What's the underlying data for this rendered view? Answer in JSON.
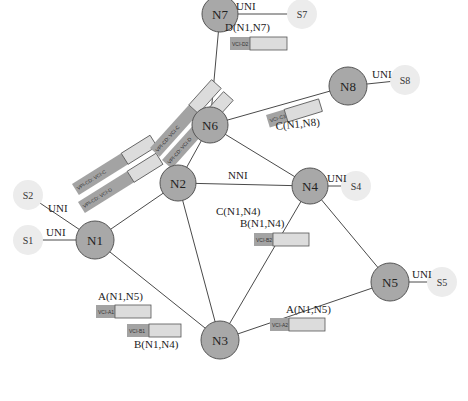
{
  "diagram": {
    "title": "",
    "colors": {
      "core_node": "#a8a8a8",
      "station_node": "#ececec",
      "box_dark": "#a3a3a3",
      "box_light": "#dcdcdc",
      "line": "#4a4a4a"
    },
    "core_nodes": [
      {
        "id": "N1",
        "label": "N1",
        "x": 95,
        "y": 240,
        "r": 19
      },
      {
        "id": "N2",
        "label": "N2",
        "x": 178,
        "y": 183,
        "r": 18
      },
      {
        "id": "N3",
        "label": "N3",
        "x": 220,
        "y": 340,
        "r": 19
      },
      {
        "id": "N4",
        "label": "N4",
        "x": 310,
        "y": 186,
        "r": 18
      },
      {
        "id": "N5",
        "label": "N5",
        "x": 390,
        "y": 282,
        "r": 19
      },
      {
        "id": "N6",
        "label": "N6",
        "x": 210,
        "y": 125,
        "r": 18
      },
      {
        "id": "N7",
        "label": "N7",
        "x": 220,
        "y": 14,
        "r": 18
      },
      {
        "id": "N8",
        "label": "N8",
        "x": 348,
        "y": 86,
        "r": 19
      }
    ],
    "stations": [
      {
        "id": "S1",
        "label": "S1",
        "x": 28,
        "y": 240,
        "r": 15
      },
      {
        "id": "S2",
        "label": "S2",
        "x": 28,
        "y": 195,
        "r": 15
      },
      {
        "id": "S4",
        "label": "S4",
        "x": 356,
        "y": 186,
        "r": 15
      },
      {
        "id": "S5",
        "label": "S5",
        "x": 442,
        "y": 282,
        "r": 15
      },
      {
        "id": "S7",
        "label": "S7",
        "x": 302,
        "y": 14,
        "r": 15
      },
      {
        "id": "S8",
        "label": "S8",
        "x": 405,
        "y": 80,
        "r": 15
      }
    ],
    "links": [
      {
        "from": "N1",
        "to": "N2"
      },
      {
        "from": "N1",
        "to": "N3"
      },
      {
        "from": "N2",
        "to": "N3"
      },
      {
        "from": "N2",
        "to": "N4"
      },
      {
        "from": "N2",
        "to": "N6"
      },
      {
        "from": "N3",
        "to": "N4"
      },
      {
        "from": "N3",
        "to": "N5"
      },
      {
        "from": "N4",
        "to": "N5"
      },
      {
        "from": "N4",
        "to": "N6"
      },
      {
        "from": "N6",
        "to": "N7"
      },
      {
        "from": "N6",
        "to": "N8"
      },
      {
        "from": "N1",
        "to": "S1"
      },
      {
        "from": "N1",
        "to": "S2"
      },
      {
        "from": "N4",
        "to": "S4"
      },
      {
        "from": "N5",
        "to": "S5"
      },
      {
        "from": "N7",
        "to": "S7"
      },
      {
        "from": "N8",
        "to": "S8"
      }
    ],
    "edge_labels": [
      {
        "text": "UNI",
        "x": 48,
        "y": 212
      },
      {
        "text": "UNI",
        "x": 46,
        "y": 236
      },
      {
        "text": "NNI",
        "x": 228,
        "y": 179
      },
      {
        "text": "UNI",
        "x": 327,
        "y": 182
      },
      {
        "text": "UNI",
        "x": 412,
        "y": 278
      },
      {
        "text": "UNI",
        "x": 236,
        "y": 10
      },
      {
        "text": "UNI",
        "x": 372,
        "y": 78
      }
    ],
    "connection_labels": [
      {
        "text": "D(N1,N7)",
        "x": 225,
        "y": 31
      },
      {
        "text": "C(N1,N8)",
        "x": 276,
        "y": 130,
        "rotate": -6
      },
      {
        "text": "C(N1,N4)",
        "x": 216,
        "y": 215
      },
      {
        "text": "B(N1,N4)",
        "x": 240,
        "y": 227
      },
      {
        "text": "A(N1,N5)",
        "x": 98,
        "y": 300
      },
      {
        "text": "B(N1,N4)",
        "x": 134,
        "y": 348
      },
      {
        "text": "A(N1,N5)",
        "x": 286,
        "y": 313
      }
    ],
    "vc_boxes": [
      {
        "label": "VCI-D2",
        "x": 230,
        "y": 37,
        "w": 57,
        "h": 13,
        "dark_w": 20,
        "rotate": 0
      },
      {
        "label": "VCI-C3",
        "x": 266,
        "y": 115,
        "w": 55,
        "h": 13,
        "dark_w": 19,
        "rotate": -17
      },
      {
        "label": "VCI-B2",
        "x": 254,
        "y": 233,
        "w": 55,
        "h": 13,
        "dark_w": 19,
        "rotate": 0
      },
      {
        "label": "VCI-A1",
        "x": 96,
        "y": 305,
        "w": 55,
        "h": 13,
        "dark_w": 19,
        "rotate": 0
      },
      {
        "label": "VCI-B1",
        "x": 127,
        "y": 324,
        "w": 54,
        "h": 13,
        "dark_w": 22,
        "rotate": 0
      },
      {
        "label": "VCI-A2",
        "x": 270,
        "y": 318,
        "w": 55,
        "h": 13,
        "dark_w": 19,
        "rotate": 0
      }
    ],
    "vp_boxes": [
      {
        "label": "VPI-CD:  VCI-C",
        "x": 72,
        "y": 184,
        "w": 92,
        "h": 13,
        "dark_w": 58,
        "rotate": -32
      },
      {
        "label": "VPI-CD:   VCI-D",
        "x": 78,
        "y": 202,
        "w": 92,
        "h": 13,
        "dark_w": 58,
        "rotate": -32
      },
      {
        "label": "VPI-CD:  VCI-C",
        "x": 150,
        "y": 148,
        "w": 92,
        "h": 13,
        "dark_w": 58,
        "rotate": -48
      },
      {
        "label": "VPI-CD:  VCI-D",
        "x": 162,
        "y": 160,
        "w": 92,
        "h": 13,
        "dark_w": 58,
        "rotate": -48
      }
    ]
  }
}
